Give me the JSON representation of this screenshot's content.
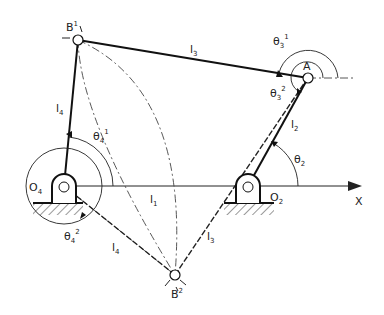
{
  "diagram": {
    "type": "four-bar linkage",
    "points": {
      "B1": {
        "label": "B",
        "sup": "1"
      },
      "B2": {
        "label": "B",
        "sup": "2"
      },
      "A": {
        "label": "A"
      },
      "O4": {
        "label": "O",
        "sub": "4"
      },
      "O2": {
        "label": "O",
        "sub": "2"
      }
    },
    "links": {
      "l1": {
        "label": "l",
        "sub": "1"
      },
      "l2": {
        "label": "l",
        "sub": "2"
      },
      "l3_top": {
        "label": "l",
        "sub": "3"
      },
      "l3_bottom": {
        "label": "l",
        "sub": "3"
      },
      "l4_top": {
        "label": "l",
        "sub": "4"
      },
      "l4_bottom": {
        "label": "l",
        "sub": "4"
      }
    },
    "angles": {
      "theta2": {
        "label": "θ",
        "sub": "2"
      },
      "theta3_1": {
        "label": "θ",
        "sub": "3",
        "sup": "1"
      },
      "theta3_2": {
        "label": "θ",
        "sub": "3",
        "sup": "2"
      },
      "theta4_1": {
        "label": "θ",
        "sub": "4",
        "sup": "1"
      },
      "theta4_2": {
        "label": "θ",
        "sub": "4",
        "sup": "2"
      }
    },
    "axis": {
      "label": "X"
    }
  }
}
